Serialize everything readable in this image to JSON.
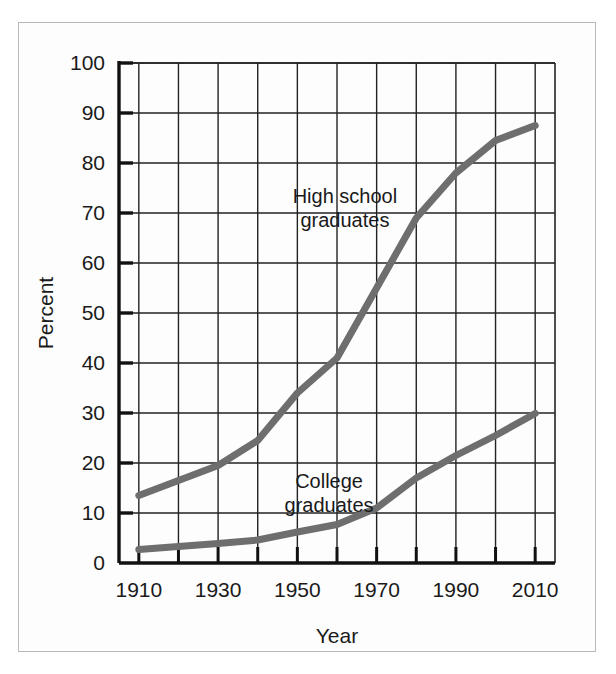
{
  "chart_data": {
    "type": "line",
    "title": "",
    "xlabel": "Year",
    "ylabel": "Percent",
    "xlim": [
      1905,
      2015
    ],
    "ylim": [
      0,
      100
    ],
    "grid": true,
    "legend_position": "inline-annotations",
    "x_tick_labels": [
      "1910",
      "1930",
      "1950",
      "1970",
      "1990",
      "2010"
    ],
    "x_tick_values": [
      1910,
      1930,
      1950,
      1970,
      1990,
      2010
    ],
    "x_minor_tick_values": [
      1920,
      1940,
      1960,
      1980,
      2000
    ],
    "y_tick_labels": [
      "0",
      "10",
      "20",
      "30",
      "40",
      "50",
      "60",
      "70",
      "80",
      "90",
      "100"
    ],
    "y_tick_values": [
      0,
      10,
      20,
      30,
      40,
      50,
      60,
      70,
      80,
      90,
      100
    ],
    "series": [
      {
        "name": "High school graduates",
        "color": "#6e6e6e",
        "x": [
          1910,
          1920,
          1930,
          1940,
          1950,
          1960,
          1970,
          1980,
          1990,
          2000,
          2010
        ],
        "values": [
          13.5,
          16.5,
          19.5,
          24.5,
          34,
          41,
          55,
          69,
          78,
          84.5,
          87.5
        ]
      },
      {
        "name": "College graduates",
        "color": "#6e6e6e",
        "x": [
          1910,
          1920,
          1930,
          1940,
          1950,
          1960,
          1970,
          1980,
          1990,
          2000,
          2010
        ],
        "values": [
          2.7,
          3.3,
          3.9,
          4.6,
          6.2,
          7.7,
          11,
          17,
          21.5,
          25.5,
          29.9
        ]
      }
    ],
    "annotations": [
      {
        "name": "high-school-graduates-label",
        "line1": "High school",
        "line2": "graduates",
        "x": 1962,
        "y": 72
      },
      {
        "name": "college-graduates-label",
        "line1": "College",
        "line2": "graduates",
        "x": 1958,
        "y": 15
      }
    ]
  },
  "axes": {
    "y_title": "Percent",
    "x_title": "Year"
  }
}
